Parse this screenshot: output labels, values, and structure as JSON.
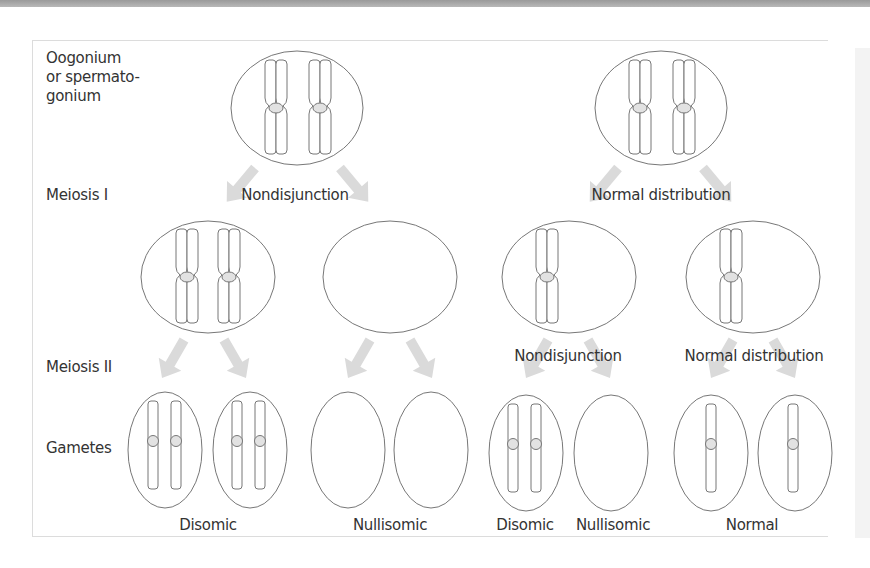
{
  "colors": {
    "text": "#333333",
    "outline": "#777777",
    "arrow": "#d8d8d8",
    "centromere": "#e0e0e0",
    "topbar": "#a8a8a8"
  },
  "row_labels": {
    "parent": "Oogonium\nor spermato-\ngonium",
    "parent_lines": [
      "Oogonium",
      "or spermato-",
      "gonium"
    ],
    "meiosis1": "Meiosis I",
    "meiosis2": "Meiosis II",
    "gametes": "Gametes"
  },
  "left_branch": {
    "meiosis1_event": "Nondisjunction",
    "cells_after_meiosis1": [
      {
        "chromosomes": 2,
        "type": "duplicated"
      },
      {
        "chromosomes": 0
      }
    ],
    "gametes": [
      {
        "chromosomes": 2
      },
      {
        "chromosomes": 2
      },
      {
        "chromosomes": 0
      },
      {
        "chromosomes": 0
      }
    ],
    "gamete_labels": [
      "Disomic",
      "Nullisomic"
    ]
  },
  "right_branch": {
    "meiosis1_event": "Normal distribution",
    "cells_after_meiosis1": [
      {
        "chromosomes": 1,
        "type": "duplicated",
        "meiosis2_event": "Nondisjunction"
      },
      {
        "chromosomes": 1,
        "type": "duplicated",
        "meiosis2_event": "Normal distribution"
      }
    ],
    "gametes": [
      {
        "chromosomes": 2
      },
      {
        "chromosomes": 0
      },
      {
        "chromosomes": 1
      },
      {
        "chromosomes": 1
      }
    ],
    "gamete_labels": [
      "Disomic",
      "Nullisomic",
      "Normal"
    ]
  }
}
